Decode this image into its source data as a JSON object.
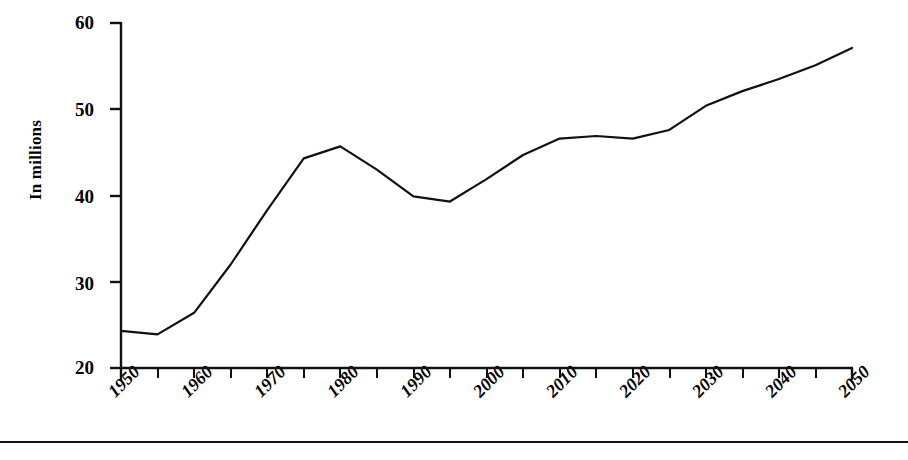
{
  "chart_data": {
    "type": "line",
    "title": "",
    "subtitle": "",
    "xlabel": "",
    "ylabel": "In millions",
    "xlim": [
      1950,
      2050
    ],
    "ylim": [
      20,
      60
    ],
    "grid": false,
    "legend": null,
    "y_ticks": [
      20,
      30,
      40,
      50,
      60
    ],
    "y_tick_labels": [
      "20",
      "30",
      "40",
      "50",
      "60"
    ],
    "x_ticks": [
      1950,
      1955,
      1960,
      1965,
      1970,
      1975,
      1980,
      1985,
      1990,
      1995,
      2000,
      2005,
      2010,
      2015,
      2020,
      2025,
      2030,
      2035,
      2040,
      2045,
      2050
    ],
    "x_tick_labels": [
      "1950",
      "1960",
      "1970",
      "1980",
      "1990",
      "2000",
      "2010",
      "2020",
      "2030",
      "2040",
      "2050"
    ],
    "x_labeled_ticks": [
      1950,
      1960,
      1970,
      1980,
      1990,
      2000,
      2010,
      2020,
      2030,
      2040,
      2050
    ],
    "line_color": "#111111",
    "line_width": 2.2,
    "x": [
      1950,
      1955,
      1960,
      1965,
      1970,
      1975,
      1980,
      1985,
      1990,
      1995,
      2000,
      2005,
      2010,
      2015,
      2020,
      2025,
      2030,
      2035,
      2040,
      2045,
      2050
    ],
    "values": [
      24.3,
      23.9,
      26.4,
      32.0,
      38.3,
      44.3,
      45.7,
      43.0,
      39.9,
      39.3,
      41.9,
      44.7,
      46.6,
      46.9,
      46.6,
      47.6,
      50.4,
      52.1,
      53.5,
      55.1,
      57.1
    ],
    "series": [
      {
        "name": "In millions",
        "values": [
          24.3,
          23.9,
          26.4,
          32.0,
          38.3,
          44.3,
          45.7,
          43.0,
          39.9,
          39.3,
          41.9,
          44.7,
          46.6,
          46.9,
          46.6,
          47.6,
          50.4,
          52.1,
          53.5,
          55.1,
          57.1
        ]
      }
    ]
  },
  "axis": {
    "y_label_text": "In millions",
    "y_labels": [
      "60",
      "50",
      "40",
      "30",
      "20"
    ],
    "x_labels": [
      "1950",
      "1960",
      "1970",
      "1980",
      "1990",
      "2000",
      "2010",
      "2020",
      "2030",
      "2040",
      "2050"
    ]
  }
}
